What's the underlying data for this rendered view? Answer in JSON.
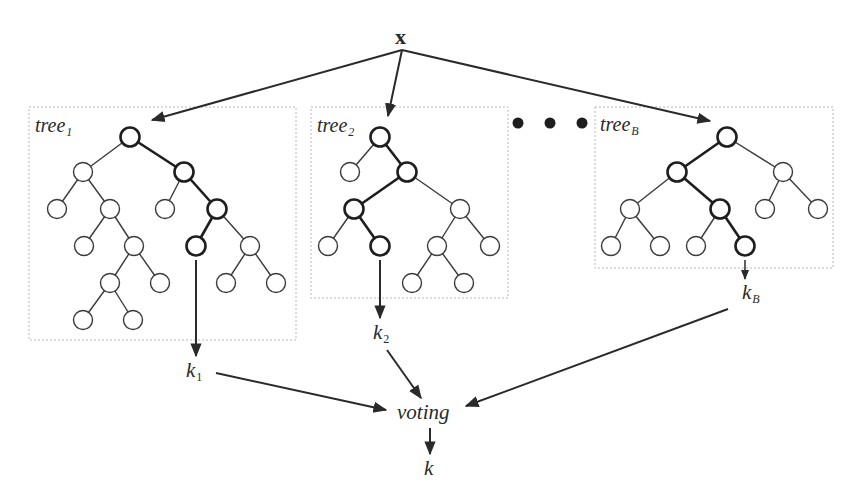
{
  "diagram": {
    "type": "random-forest-ensemble",
    "input": {
      "label": "x"
    },
    "ellipsis": "• • •",
    "trees": [
      {
        "id": "tree1",
        "title": "tree",
        "title_sub": "1",
        "box": {
          "x": 29,
          "y": 107,
          "w": 267,
          "h": 233
        },
        "output": {
          "label": "k",
          "sub": "1"
        },
        "nodes": [
          [
            130,
            137
          ],
          [
            83,
            172
          ],
          [
            184,
            172
          ],
          [
            57,
            209
          ],
          [
            110,
            209
          ],
          [
            165,
            209
          ],
          [
            217,
            209
          ],
          [
            84,
            246
          ],
          [
            134,
            246
          ],
          [
            196,
            246
          ],
          [
            250,
            246
          ],
          [
            110,
            283
          ],
          [
            160,
            283
          ],
          [
            226,
            283
          ],
          [
            276,
            283
          ],
          [
            83,
            320
          ],
          [
            133,
            320
          ]
        ],
        "edges": [
          [
            0,
            1
          ],
          [
            0,
            2
          ],
          [
            1,
            3
          ],
          [
            1,
            4
          ],
          [
            2,
            5
          ],
          [
            2,
            6
          ],
          [
            4,
            7
          ],
          [
            4,
            8
          ],
          [
            6,
            9
          ],
          [
            6,
            10
          ],
          [
            8,
            11
          ],
          [
            8,
            12
          ],
          [
            10,
            13
          ],
          [
            10,
            14
          ],
          [
            11,
            15
          ],
          [
            11,
            16
          ]
        ],
        "path": [
          0,
          2,
          6,
          9
        ]
      },
      {
        "id": "tree2",
        "title": "tree",
        "title_sub": "2",
        "box": {
          "x": 311,
          "y": 107,
          "w": 197,
          "h": 191
        },
        "output": {
          "label": "k",
          "sub": "2"
        },
        "nodes": [
          [
            380,
            137
          ],
          [
            350,
            172
          ],
          [
            407,
            172
          ],
          [
            354,
            209
          ],
          [
            460,
            209
          ],
          [
            328,
            246
          ],
          [
            380,
            246
          ],
          [
            437,
            246
          ],
          [
            490,
            246
          ],
          [
            412,
            283
          ],
          [
            464,
            283
          ]
        ],
        "edges": [
          [
            0,
            1
          ],
          [
            0,
            2
          ],
          [
            2,
            3
          ],
          [
            2,
            4
          ],
          [
            3,
            5
          ],
          [
            3,
            6
          ],
          [
            4,
            7
          ],
          [
            4,
            8
          ],
          [
            7,
            9
          ],
          [
            7,
            10
          ]
        ],
        "path": [
          0,
          2,
          3,
          6
        ]
      },
      {
        "id": "treeB",
        "title": "tree",
        "title_sub": "B",
        "box": {
          "x": 595,
          "y": 107,
          "w": 238,
          "h": 161
        },
        "output": {
          "label": "k",
          "sub": "B"
        },
        "nodes": [
          [
            727,
            137
          ],
          [
            677,
            172
          ],
          [
            783,
            172
          ],
          [
            630,
            209
          ],
          [
            720,
            209
          ],
          [
            765,
            209
          ],
          [
            818,
            209
          ],
          [
            611,
            246
          ],
          [
            660,
            246
          ],
          [
            696,
            246
          ],
          [
            745,
            246
          ]
        ],
        "edges": [
          [
            0,
            1
          ],
          [
            0,
            2
          ],
          [
            1,
            3
          ],
          [
            1,
            4
          ],
          [
            2,
            5
          ],
          [
            2,
            6
          ],
          [
            3,
            7
          ],
          [
            3,
            8
          ],
          [
            4,
            9
          ],
          [
            4,
            10
          ]
        ],
        "path": [
          0,
          1,
          4,
          10
        ]
      }
    ],
    "aggregator": {
      "label": "voting"
    },
    "final_output": {
      "label": "k"
    }
  },
  "colors": {
    "line": "#3a3a3a",
    "path": "#1e1e1e",
    "box_border": "#b8b8b8",
    "node_fill": "#ffffff"
  }
}
